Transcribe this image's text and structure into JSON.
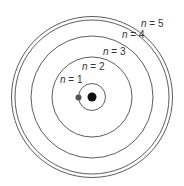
{
  "diagram": {
    "center": [
      92,
      97
    ],
    "orbits": [
      {
        "label_var": "n",
        "label_eq": " = 1",
        "r": 13.5,
        "label_pos": [
          60,
          83
        ]
      },
      {
        "label_var": "n",
        "label_eq": " = 2",
        "r": 40,
        "label_pos": [
          82,
          70
        ]
      },
      {
        "label_var": "n",
        "label_eq": " = 3",
        "r": 61,
        "label_pos": [
          103,
          55
        ]
      },
      {
        "label_var": "n",
        "label_eq": " = 4",
        "r": 77,
        "label_pos": [
          122,
          38
        ]
      },
      {
        "label_var": "n",
        "label_eq": " = 5",
        "r": 80.5,
        "label_pos": [
          141,
          27
        ]
      }
    ],
    "nucleus": {
      "r": 4.5,
      "color": "#111111"
    },
    "electron": {
      "cx": 78.5,
      "cy": 97.5,
      "r": 3,
      "color": "#555555"
    },
    "line_color": "#333333"
  }
}
